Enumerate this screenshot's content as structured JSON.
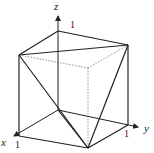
{
  "diagram": {
    "type": "unit-cube-3d",
    "axes": {
      "x": {
        "label": "x",
        "tick": "1"
      },
      "y": {
        "label": "y",
        "tick": "1"
      },
      "z": {
        "label": "z",
        "tick": "1"
      }
    },
    "colors": {
      "line": "#222222",
      "hidden": "#777777",
      "background": "#ffffff"
    }
  }
}
